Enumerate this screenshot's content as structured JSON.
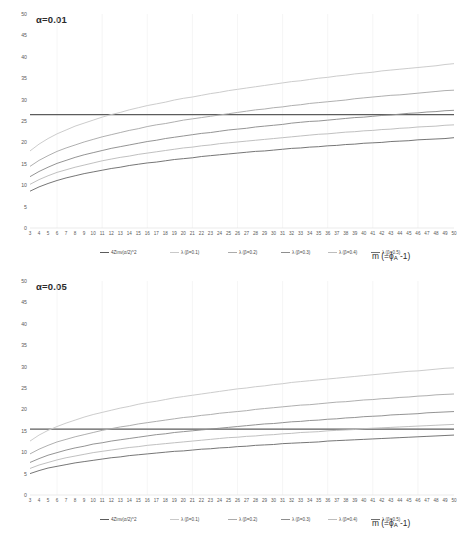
{
  "figure": {
    "width": 466,
    "height": 533,
    "background": "#ffffff"
  },
  "axis_title_x": "m (=ϕA -1)",
  "panels": [
    {
      "id": "panel-alpha-001",
      "title": "α=0.01",
      "xlabel": "m (=ϕA -1)",
      "ylabel": "",
      "xlim": [
        3,
        50
      ],
      "ylim": [
        0,
        50
      ],
      "yticks": [
        0,
        5,
        10,
        15,
        20,
        25,
        30,
        35,
        40,
        45,
        50
      ],
      "xticks": [
        3,
        4,
        5,
        6,
        7,
        8,
        9,
        10,
        11,
        12,
        13,
        14,
        15,
        16,
        17,
        18,
        19,
        20,
        21,
        22,
        23,
        24,
        25,
        26,
        27,
        28,
        29,
        30,
        31,
        32,
        33,
        34,
        35,
        36,
        37,
        38,
        39,
        40,
        41,
        42,
        43,
        44,
        45,
        46,
        47,
        48,
        49,
        50
      ]
    },
    {
      "id": "panel-alpha-005",
      "title": "α=0.05",
      "xlabel": "m (=ϕA -1)",
      "ylabel": "",
      "xlim": [
        3,
        50
      ],
      "ylim": [
        0,
        50
      ],
      "yticks": [
        0,
        5,
        10,
        15,
        20,
        25,
        30,
        35,
        40,
        45,
        50
      ],
      "xticks": [
        3,
        4,
        5,
        6,
        7,
        8,
        9,
        10,
        11,
        12,
        13,
        14,
        15,
        16,
        17,
        18,
        19,
        20,
        21,
        22,
        23,
        24,
        25,
        26,
        27,
        28,
        29,
        30,
        31,
        32,
        33,
        34,
        35,
        36,
        37,
        38,
        39,
        40,
        41,
        42,
        43,
        44,
        45,
        46,
        47,
        48,
        49,
        50
      ]
    }
  ],
  "legend": {
    "items": [
      {
        "label": "4Zinv(α/2)^2",
        "color": "#5c5c5c"
      },
      {
        "label": "λ (β=0.1)",
        "color": "#c9c9c9"
      },
      {
        "label": "λ (β=0.2)",
        "color": "#ababab"
      },
      {
        "label": "λ (β=0.3)",
        "color": "#8e8e8e"
      },
      {
        "label": "λ (β=0.4)",
        "color": "#bdbdbd"
      },
      {
        "label": "λ (β=0.5)",
        "color": "#6f6f6f"
      }
    ]
  },
  "chart_data": [
    {
      "type": "line",
      "title": "α=0.01",
      "xlabel": "m (=ϕA -1)",
      "ylabel": "",
      "xlim": [
        3,
        50
      ],
      "ylim": [
        0,
        50
      ],
      "grid": false,
      "legend_position": "bottom",
      "x": [
        3,
        4,
        5,
        6,
        7,
        8,
        9,
        10,
        11,
        12,
        13,
        14,
        15,
        16,
        17,
        18,
        19,
        20,
        21,
        22,
        23,
        24,
        25,
        26,
        27,
        28,
        29,
        30,
        31,
        32,
        33,
        34,
        35,
        36,
        37,
        38,
        39,
        40,
        41,
        42,
        43,
        44,
        45,
        46,
        47,
        48,
        49,
        50
      ],
      "series": [
        {
          "name": "4Zinv(α/2)^2",
          "color": "#5c5c5c",
          "constant": 26.5,
          "values": [
            26.5,
            26.5,
            26.5,
            26.5,
            26.5,
            26.5,
            26.5,
            26.5,
            26.5,
            26.5,
            26.5,
            26.5,
            26.5,
            26.5,
            26.5,
            26.5,
            26.5,
            26.5,
            26.5,
            26.5,
            26.5,
            26.5,
            26.5,
            26.5,
            26.5,
            26.5,
            26.5,
            26.5,
            26.5,
            26.5,
            26.5,
            26.5,
            26.5,
            26.5,
            26.5,
            26.5,
            26.5,
            26.5,
            26.5,
            26.5,
            26.5,
            26.5,
            26.5,
            26.5,
            26.5,
            26.5,
            26.5,
            26.5
          ]
        },
        {
          "name": "λ (β=0.1)",
          "color": "#c9c9c9",
          "values": [
            18.0,
            19.6,
            20.9,
            22.0,
            22.9,
            23.8,
            24.5,
            25.2,
            25.9,
            26.5,
            27.0,
            27.6,
            28.1,
            28.6,
            29.0,
            29.4,
            29.9,
            30.3,
            30.6,
            31.0,
            31.4,
            31.7,
            32.1,
            32.4,
            32.7,
            33.0,
            33.3,
            33.6,
            33.9,
            34.2,
            34.4,
            34.7,
            35.0,
            35.2,
            35.5,
            35.7,
            36.0,
            36.2,
            36.4,
            36.7,
            36.9,
            37.1,
            37.3,
            37.5,
            37.7,
            37.9,
            38.2,
            38.4
          ]
        },
        {
          "name": "λ (β=0.2)",
          "color": "#ababab",
          "values": [
            14.4,
            15.8,
            16.9,
            17.9,
            18.7,
            19.4,
            20.1,
            20.7,
            21.3,
            21.8,
            22.3,
            22.8,
            23.2,
            23.7,
            24.1,
            24.4,
            24.8,
            25.2,
            25.5,
            25.8,
            26.1,
            26.4,
            26.7,
            27.0,
            27.3,
            27.6,
            27.8,
            28.1,
            28.3,
            28.6,
            28.8,
            29.1,
            29.3,
            29.5,
            29.7,
            29.9,
            30.2,
            30.4,
            30.6,
            30.8,
            31.0,
            31.1,
            31.3,
            31.5,
            31.7,
            31.9,
            32.1,
            32.2
          ]
        },
        {
          "name": "λ (β=0.3)",
          "color": "#8e8e8e",
          "values": [
            12.0,
            13.2,
            14.2,
            15.1,
            15.8,
            16.5,
            17.1,
            17.6,
            18.1,
            18.6,
            19.0,
            19.4,
            19.8,
            20.2,
            20.5,
            20.9,
            21.2,
            21.5,
            21.8,
            22.1,
            22.3,
            22.6,
            22.9,
            23.1,
            23.3,
            23.6,
            23.8,
            24.0,
            24.2,
            24.5,
            24.7,
            24.9,
            25.0,
            25.2,
            25.4,
            25.6,
            25.8,
            25.9,
            26.1,
            26.3,
            26.4,
            26.6,
            26.8,
            26.9,
            27.1,
            27.2,
            27.4,
            27.5
          ]
        },
        {
          "name": "λ (β=0.4)",
          "color": "#bdbdbd",
          "values": [
            10.2,
            11.3,
            12.2,
            13.0,
            13.6,
            14.2,
            14.7,
            15.2,
            15.7,
            16.1,
            16.5,
            16.8,
            17.2,
            17.5,
            17.8,
            18.1,
            18.4,
            18.7,
            18.9,
            19.2,
            19.4,
            19.7,
            19.9,
            20.1,
            20.3,
            20.5,
            20.7,
            20.9,
            21.1,
            21.3,
            21.5,
            21.7,
            21.9,
            22.0,
            22.2,
            22.4,
            22.5,
            22.7,
            22.8,
            23.0,
            23.1,
            23.3,
            23.4,
            23.6,
            23.7,
            23.8,
            24.0,
            24.1
          ]
        },
        {
          "name": "λ (β=0.5)",
          "color": "#6f6f6f",
          "values": [
            8.6,
            9.6,
            10.4,
            11.1,
            11.7,
            12.2,
            12.7,
            13.1,
            13.5,
            13.9,
            14.2,
            14.6,
            14.9,
            15.2,
            15.4,
            15.7,
            16.0,
            16.2,
            16.4,
            16.7,
            16.9,
            17.1,
            17.3,
            17.5,
            17.7,
            17.9,
            18.0,
            18.2,
            18.4,
            18.6,
            18.7,
            18.9,
            19.0,
            19.2,
            19.3,
            19.5,
            19.6,
            19.8,
            19.9,
            20.0,
            20.2,
            20.3,
            20.4,
            20.6,
            20.7,
            20.8,
            20.9,
            21.1
          ]
        }
      ]
    },
    {
      "type": "line",
      "title": "α=0.05",
      "xlabel": "m (=ϕA -1)",
      "ylabel": "",
      "xlim": [
        3,
        50
      ],
      "ylim": [
        0,
        50
      ],
      "grid": false,
      "legend_position": "bottom",
      "x": [
        3,
        4,
        5,
        6,
        7,
        8,
        9,
        10,
        11,
        12,
        13,
        14,
        15,
        16,
        17,
        18,
        19,
        20,
        21,
        22,
        23,
        24,
        25,
        26,
        27,
        28,
        29,
        30,
        31,
        32,
        33,
        34,
        35,
        36,
        37,
        38,
        39,
        40,
        41,
        42,
        43,
        44,
        45,
        46,
        47,
        48,
        49,
        50
      ],
      "series": [
        {
          "name": "4Zinv(α/2)^2",
          "color": "#5c5c5c",
          "constant": 15.4,
          "values": [
            15.4,
            15.4,
            15.4,
            15.4,
            15.4,
            15.4,
            15.4,
            15.4,
            15.4,
            15.4,
            15.4,
            15.4,
            15.4,
            15.4,
            15.4,
            15.4,
            15.4,
            15.4,
            15.4,
            15.4,
            15.4,
            15.4,
            15.4,
            15.4,
            15.4,
            15.4,
            15.4,
            15.4,
            15.4,
            15.4,
            15.4,
            15.4,
            15.4,
            15.4,
            15.4,
            15.4,
            15.4,
            15.4,
            15.4,
            15.4,
            15.4,
            15.4,
            15.4,
            15.4,
            15.4,
            15.4,
            15.4,
            15.4
          ]
        },
        {
          "name": "λ (β=0.1)",
          "color": "#c9c9c9",
          "values": [
            12.6,
            14.0,
            15.1,
            16.0,
            16.8,
            17.5,
            18.2,
            18.8,
            19.3,
            19.8,
            20.3,
            20.7,
            21.2,
            21.6,
            21.9,
            22.3,
            22.7,
            23.0,
            23.3,
            23.6,
            23.9,
            24.2,
            24.5,
            24.8,
            25.0,
            25.3,
            25.5,
            25.8,
            26.0,
            26.3,
            26.5,
            26.7,
            26.9,
            27.1,
            27.3,
            27.5,
            27.7,
            27.9,
            28.1,
            28.3,
            28.5,
            28.7,
            28.9,
            29.0,
            29.2,
            29.4,
            29.6,
            29.7
          ]
        },
        {
          "name": "λ (β=0.2)",
          "color": "#ababab",
          "values": [
            9.6,
            10.7,
            11.6,
            12.4,
            13.0,
            13.6,
            14.1,
            14.6,
            15.1,
            15.5,
            15.9,
            16.2,
            16.6,
            16.9,
            17.2,
            17.5,
            17.8,
            18.1,
            18.3,
            18.6,
            18.8,
            19.1,
            19.3,
            19.5,
            19.7,
            20.0,
            20.2,
            20.4,
            20.6,
            20.8,
            21.0,
            21.1,
            21.3,
            21.5,
            21.7,
            21.8,
            22.0,
            22.2,
            22.3,
            22.5,
            22.6,
            22.8,
            22.9,
            23.1,
            23.2,
            23.4,
            23.5,
            23.6
          ]
        },
        {
          "name": "λ (β=0.3)",
          "color": "#8e8e8e",
          "values": [
            7.6,
            8.5,
            9.3,
            9.9,
            10.5,
            11.0,
            11.4,
            11.9,
            12.2,
            12.6,
            12.9,
            13.2,
            13.5,
            13.8,
            14.1,
            14.3,
            14.6,
            14.8,
            15.0,
            15.2,
            15.4,
            15.6,
            15.8,
            16.0,
            16.2,
            16.4,
            16.6,
            16.7,
            16.9,
            17.1,
            17.2,
            17.4,
            17.5,
            17.7,
            17.8,
            18.0,
            18.1,
            18.3,
            18.4,
            18.5,
            18.7,
            18.8,
            18.9,
            19.0,
            19.2,
            19.3,
            19.4,
            19.5
          ]
        },
        {
          "name": "λ (β=0.4)",
          "color": "#bdbdbd",
          "values": [
            6.2,
            7.0,
            7.6,
            8.2,
            8.7,
            9.1,
            9.5,
            9.9,
            10.2,
            10.5,
            10.8,
            11.1,
            11.3,
            11.6,
            11.8,
            12.0,
            12.2,
            12.4,
            12.6,
            12.8,
            13.0,
            13.2,
            13.4,
            13.5,
            13.7,
            13.8,
            14.0,
            14.1,
            14.3,
            14.4,
            14.6,
            14.7,
            14.8,
            15.0,
            15.1,
            15.2,
            15.3,
            15.5,
            15.6,
            15.7,
            15.8,
            15.9,
            16.0,
            16.1,
            16.2,
            16.3,
            16.4,
            16.5
          ]
        },
        {
          "name": "λ (β=0.5)",
          "color": "#6f6f6f",
          "values": [
            5.0,
            5.7,
            6.3,
            6.7,
            7.1,
            7.5,
            7.8,
            8.1,
            8.4,
            8.7,
            8.9,
            9.2,
            9.4,
            9.6,
            9.8,
            10.0,
            10.2,
            10.3,
            10.5,
            10.7,
            10.8,
            11.0,
            11.1,
            11.3,
            11.4,
            11.6,
            11.7,
            11.8,
            12.0,
            12.1,
            12.2,
            12.3,
            12.4,
            12.6,
            12.7,
            12.8,
            12.9,
            13.0,
            13.1,
            13.2,
            13.3,
            13.4,
            13.5,
            13.6,
            13.7,
            13.8,
            13.9,
            14.0
          ]
        }
      ]
    }
  ]
}
